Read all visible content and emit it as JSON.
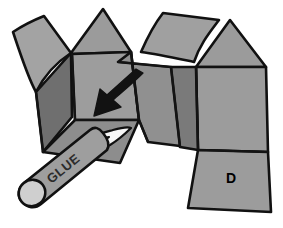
{
  "figure": {
    "background_color": "#ffffff",
    "outline_color": "#111111",
    "fold_line_color": "#1a1a1a"
  },
  "palette": {
    "panel_light": "#a3a3a3",
    "panel_mid": "#999999",
    "panel_dark": "#767676",
    "panel_darker": "#6b6b6b",
    "panel_shadow": "#5e5e5e",
    "glue_body": "#9e9e9e",
    "glue_cap": "#cccccc",
    "glue_tip_white": "#f4f4f4",
    "arrow_color": "#121212",
    "outline": "#111111"
  },
  "labels": {
    "panel_d": "D",
    "glue_text": "GLUE"
  },
  "elements": {
    "left_flap": "left-curved-flap",
    "left_gable_triangle": "left-gable-triangle",
    "front_panel": "front-panel",
    "left_side_panel": "left-side-panel",
    "bottom_left_panel": "bottom-left-panel",
    "top_flap": "top-curved-flap",
    "right_gable_triangle": "right-gable-triangle",
    "right_panel": "right-panel",
    "right_side_panel": "right-side-panel",
    "d_panel": "panel-d",
    "center_wedge": "center-wedge-panel",
    "fold_arrow": "fold-direction-arrow",
    "glue_stick": "glue-stick",
    "glue_trail": "glue-application-trail"
  }
}
